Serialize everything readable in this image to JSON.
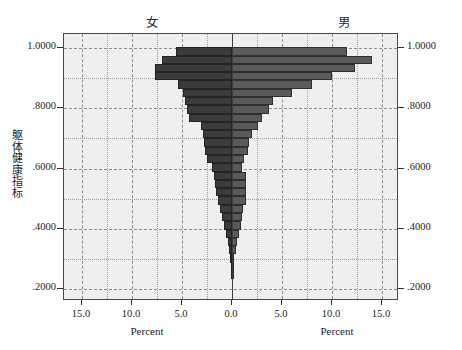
{
  "artifact": {
    "top_noise": "· · · ·  ·  · ·· · · ·   ·  · ·· ·  ·  · · ·"
  },
  "headings": {
    "female": "女",
    "male": "男"
  },
  "axes": {
    "y_label": "躯体健康指标",
    "y_ticks": [
      "1.0000",
      ".8000",
      ".6000",
      ".4000",
      ".2000"
    ],
    "x_ticks_left": [
      "15.0",
      "10.0",
      "5.0"
    ],
    "x_tick_center": "0.0",
    "x_ticks_right": [
      "5.0",
      "10.0",
      "15.0"
    ],
    "x_caption_left": "Percent",
    "x_caption_right": "Percent"
  },
  "colors": {
    "female_bar": "#3b3b3b",
    "male_bar": "#5b5b5b",
    "plot_background": "#efefef",
    "frame": "#4a4a4a",
    "grid": "#8d8d8d"
  },
  "chart_data": {
    "type": "bar",
    "subtype": "population-pyramid",
    "orientation": "horizontal-back-to-back",
    "title": "",
    "xlabel": "Percent",
    "ylabel": "躯体健康指标",
    "xlim": [
      0,
      15
    ],
    "ylim": [
      0.2,
      1.0
    ],
    "grid": true,
    "legend": [
      "女",
      "男"
    ],
    "legend_position": "top",
    "bin_height": 0.0275,
    "categories": [
      1.0,
      0.9725,
      0.945,
      0.9175,
      0.89,
      0.8625,
      0.835,
      0.8075,
      0.78,
      0.7525,
      0.725,
      0.6975,
      0.67,
      0.6425,
      0.615,
      0.5875,
      0.56,
      0.5325,
      0.505,
      0.4775,
      0.45,
      0.4225,
      0.395,
      0.3675,
      0.34,
      0.3125,
      0.285,
      0.2575
    ],
    "series": [
      {
        "name": "女",
        "side": "left",
        "color": "#3b3b3b",
        "values": [
          5.6,
          7.0,
          7.7,
          7.7,
          5.4,
          4.9,
          4.7,
          4.5,
          4.3,
          3.1,
          2.9,
          2.8,
          2.7,
          2.5,
          2.0,
          1.8,
          1.7,
          1.6,
          1.4,
          1.2,
          1.0,
          0.8,
          0.6,
          0.45,
          0.3,
          0.2,
          0.12,
          0.07
        ]
      },
      {
        "name": "男",
        "side": "right",
        "color": "#5b5b5b",
        "values": [
          11.5,
          14.0,
          12.3,
          10.0,
          8.0,
          6.0,
          4.1,
          3.7,
          3.0,
          2.6,
          2.0,
          1.7,
          1.6,
          1.2,
          1.0,
          1.4,
          1.4,
          1.4,
          1.4,
          1.1,
          1.0,
          0.9,
          0.65,
          0.5,
          0.35,
          0.2,
          0.12,
          0.07
        ]
      }
    ]
  }
}
